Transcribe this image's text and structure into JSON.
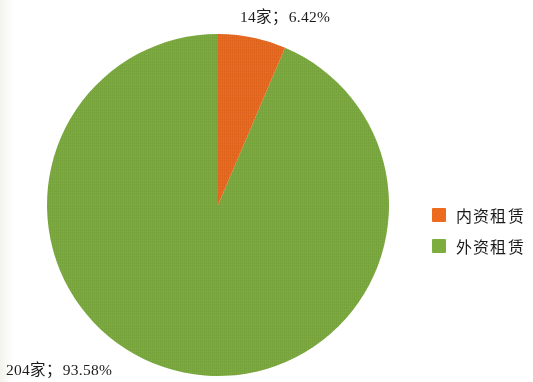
{
  "chart_data": {
    "type": "pie",
    "title": "",
    "subtitle": "",
    "xlabel": "",
    "ylabel": "",
    "categories": [
      "内资租赁",
      "外资租赁"
    ],
    "values": [
      14,
      204
    ],
    "percentages": [
      6.42,
      93.58
    ],
    "total": 218,
    "units": "家",
    "slices": [
      {
        "name": "内资租赁",
        "value": 14,
        "percent": 6.42,
        "color": "#ED6B1F",
        "data_label": "14家；6.42%",
        "start_angle_deg": 0,
        "sweep_angle_deg": 23.1
      },
      {
        "name": "外资租赁",
        "value": 204,
        "percent": 93.58,
        "color": "#7DAD3F",
        "data_label": "204家；93.58%",
        "start_angle_deg": 23.1,
        "sweep_angle_deg": 336.9
      }
    ],
    "legend": {
      "position": "right",
      "entries": [
        {
          "label": "内资租赁",
          "color": "#ED6B1F"
        },
        {
          "label": "外资租赁",
          "color": "#7DAD3F"
        }
      ]
    },
    "annotations": [
      {
        "id": "top",
        "text": "14家；6.42%",
        "anchor": "内资租赁"
      },
      {
        "id": "bottom",
        "text": "204家；93.58%",
        "anchor": "外资租赁"
      }
    ],
    "grid": false,
    "start_angle_note": "first slice begins at 12 o'clock, drawn clockwise"
  },
  "labels": {
    "top": "14家；6.42%",
    "bottom": "204家；93.58%"
  },
  "legend": {
    "items": [
      {
        "label": "内资租赁",
        "color": "#ED6B1F"
      },
      {
        "label": "外资租赁",
        "color": "#7DAD3F"
      }
    ]
  },
  "colors": {
    "domestic_orange": "#ED6B1F",
    "foreign_green": "#7DAD3F",
    "background": "#FFFFFF",
    "text": "#1B1B1B"
  }
}
